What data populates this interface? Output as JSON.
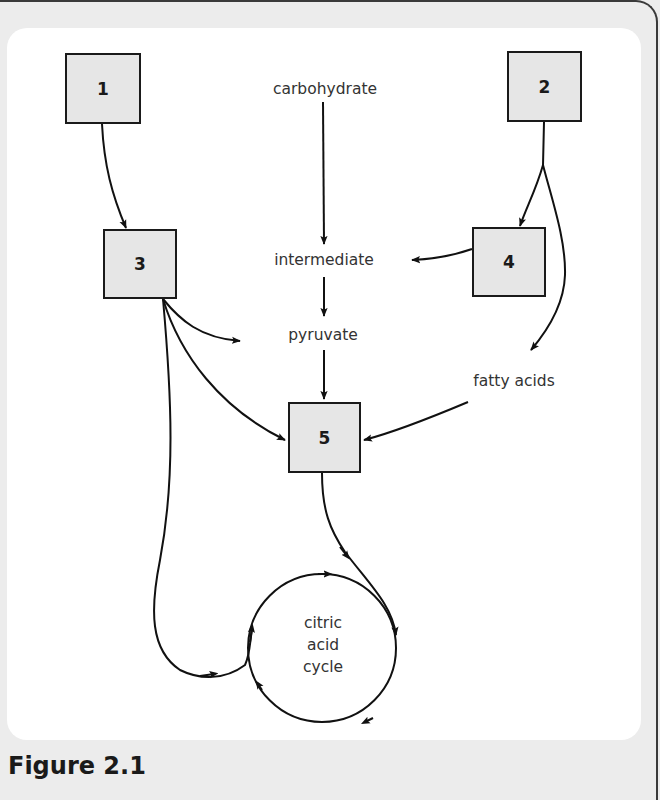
{
  "diagram": {
    "boxes": [
      {
        "id": "1",
        "label": "1"
      },
      {
        "id": "2",
        "label": "2"
      },
      {
        "id": "3",
        "label": "3"
      },
      {
        "id": "4",
        "label": "4"
      },
      {
        "id": "5",
        "label": "5"
      }
    ],
    "nodes": {
      "carbohydrate": "carbohydrate",
      "intermediate": "intermediate",
      "pyruvate": "pyruvate",
      "fatty_acids": "fatty acids",
      "cycle_line1": "citric",
      "cycle_line2": "acid",
      "cycle_line3": "cycle"
    },
    "edges": [
      {
        "from": "1",
        "to": "3"
      },
      {
        "from": "2",
        "to": "4"
      },
      {
        "from": "2",
        "to": "fatty acids"
      },
      {
        "from": "carbohydrate",
        "to": "intermediate"
      },
      {
        "from": "4",
        "to": "intermediate"
      },
      {
        "from": "intermediate",
        "to": "pyruvate"
      },
      {
        "from": "3",
        "to": "pyruvate"
      },
      {
        "from": "3",
        "to": "5"
      },
      {
        "from": "3",
        "to": "citric acid cycle"
      },
      {
        "from": "pyruvate",
        "to": "5"
      },
      {
        "from": "fatty acids",
        "to": "5"
      },
      {
        "from": "5",
        "to": "citric acid cycle"
      }
    ],
    "caption": "Figure 2.1"
  }
}
